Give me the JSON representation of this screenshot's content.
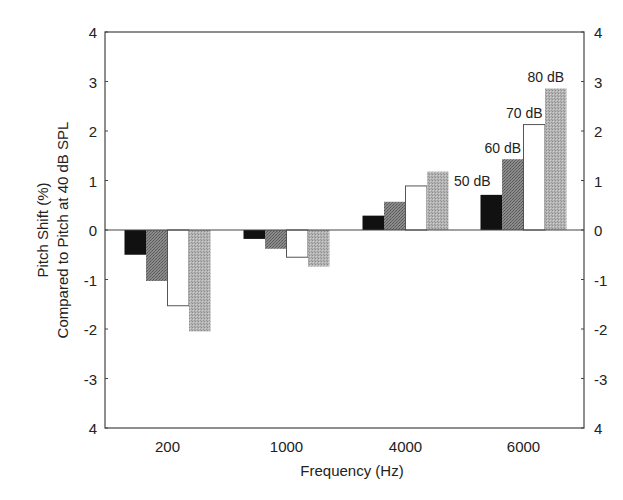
{
  "chart_data": {
    "type": "bar",
    "title": "",
    "xlabel": "Frequency (Hz)",
    "ylabel": [
      "Pitch Shift (%)",
      "Compared to Pitch at 40 dB SPL"
    ],
    "categories": [
      "200",
      "1000",
      "4000",
      "6000"
    ],
    "series": [
      {
        "name": "50 dB",
        "color": "#111111",
        "pattern": "solid",
        "values": [
          -0.5,
          -0.18,
          0.29,
          0.71
        ]
      },
      {
        "name": "60 dB",
        "color": "#7a7a7a",
        "pattern": "stipple-dark",
        "values": [
          -1.03,
          -0.38,
          0.57,
          1.43
        ]
      },
      {
        "name": "70 dB",
        "color": "#ffffff",
        "pattern": "open",
        "values": [
          -1.53,
          -0.55,
          0.89,
          2.13
        ]
      },
      {
        "name": "80 dB",
        "color": "#ababab",
        "pattern": "stipple-light",
        "values": [
          -2.05,
          -0.74,
          1.18,
          2.86
        ]
      }
    ],
    "ylim": [
      -4,
      4
    ],
    "yticks": [
      4,
      3,
      2,
      1,
      0,
      -1,
      -2,
      -3,
      -4
    ],
    "ytick_labels": [
      "4",
      "3",
      "2",
      "1",
      "0",
      "-1",
      "-2",
      "-3",
      "4"
    ],
    "right_axis_mirror": true,
    "grid": false,
    "legend": "inline annotations above the 6000 Hz group",
    "annotations": [
      {
        "text": "50 dB",
        "series": "50 dB"
      },
      {
        "text": "60 dB",
        "series": "60 dB"
      },
      {
        "text": "70 dB",
        "series": "70 dB"
      },
      {
        "text": "80 dB",
        "series": "80 dB"
      }
    ]
  }
}
